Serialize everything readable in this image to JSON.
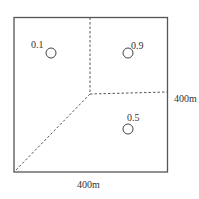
{
  "diagram": {
    "square": {
      "x": 14,
      "y": 17,
      "size": 154,
      "stroke": "#555555"
    },
    "center_point": {
      "x": 90,
      "y": 94
    },
    "dashed_lines": [
      {
        "x1": 90,
        "y1": 17,
        "x2": 90,
        "y2": 94
      },
      {
        "x1": 90,
        "y1": 94,
        "x2": 168,
        "y2": 92
      },
      {
        "x1": 90,
        "y1": 94,
        "x2": 14,
        "y2": 172
      }
    ],
    "sites": [
      {
        "label": "0.1",
        "cx": 51,
        "cy": 53,
        "lx": 31,
        "ly": 48
      },
      {
        "label": "0.9",
        "cx": 128,
        "cy": 53,
        "lx": 132,
        "ly": 48
      },
      {
        "label": "0.5",
        "cx": 128,
        "cy": 129,
        "lx": 128,
        "ly": 121
      }
    ],
    "dimension_right": "400m",
    "dimension_bottom": "400m"
  }
}
